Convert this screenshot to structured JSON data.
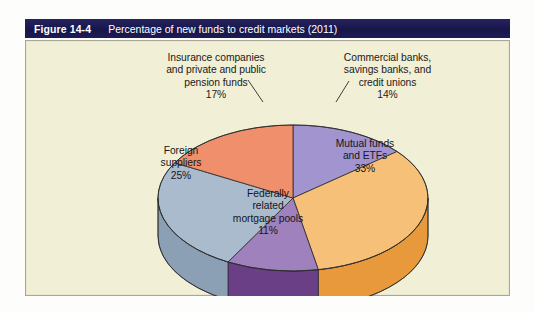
{
  "figure": {
    "number": "Figure 14-4",
    "caption": "Percentage of new funds to credit markets (2011)"
  },
  "colors": {
    "title_bar": "#1b1a52",
    "panel_background": "#f1efd6",
    "panel_border": "#a9a79a",
    "page_background": "#ffffff"
  },
  "chart_data": {
    "type": "pie",
    "title": "Percentage of new funds to credit markets (2011)",
    "style": "3d-pie",
    "units": "percent",
    "legend_position": "none",
    "grid": false,
    "labels_inline": true,
    "total": 100,
    "categories": [
      "Commercial banks, savings banks, and credit unions",
      "Mutual funds and ETFs",
      "Federally related mortgage pools",
      "Foreign suppliers",
      "Insurance companies and private and public pension funds"
    ],
    "values": [
      14,
      33,
      11,
      25,
      17
    ],
    "slices": [
      {
        "id": "commercial-banks",
        "label": "Commercial banks,\nsavings banks, and\ncredit unions\n14%",
        "name": "Commercial banks, savings banks, and credit unions",
        "value": 14,
        "value_text": "14%",
        "top_color": "#a294ce",
        "side_color": "#7a6cae",
        "label_placement": "callout-top-right"
      },
      {
        "id": "mutual-funds",
        "label": "Mutual funds\nand ETFs\n33%",
        "name": "Mutual funds and ETFs",
        "value": 33,
        "value_text": "33%",
        "top_color": "#f6c078",
        "side_color": "#e8993c",
        "label_placement": "inside-right"
      },
      {
        "id": "federally-related-mortgage-pools",
        "label": "Federally\nrelated\nmortgage pools\n11%",
        "name": "Federally related mortgage pools",
        "value": 11,
        "value_text": "11%",
        "top_color": "#9e81bd",
        "side_color": "#6a3f86",
        "label_placement": "inside-bottom"
      },
      {
        "id": "foreign-suppliers",
        "label": "Foreign\nsuppliers\n25%",
        "name": "Foreign suppliers",
        "value": 25,
        "value_text": "25%",
        "top_color": "#a9bbcc",
        "side_color": "#8ba0b4",
        "label_placement": "inside-left"
      },
      {
        "id": "insurance-pension",
        "label": "Insurance companies\nand private and public\npension funds\n17%",
        "name": "Insurance companies and private and public pension funds",
        "value": 17,
        "value_text": "17%",
        "top_color": "#ef8f6b",
        "side_color": "#d9714d",
        "label_placement": "callout-top-left"
      }
    ]
  }
}
